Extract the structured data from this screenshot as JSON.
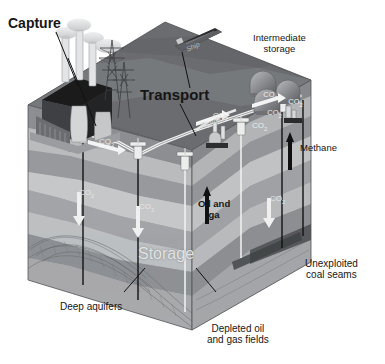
{
  "figure": {
    "style": "isometric cutaway block diagram, grayscale"
  },
  "labels": {
    "capture": "Capture",
    "transport": "Transport",
    "intermediate_storage": "Intermediate\nstorage",
    "storage": "Storage",
    "methane": "Methane",
    "oil_and_gas": "Oil and\nga",
    "deep_aquifers": "Deep aquifers",
    "depleted_fields": "Depleted oil\nand gas fields",
    "coal_seams": "Unexploited\ncoal seams",
    "pipeline": "Pipeline",
    "ship": "Ship"
  },
  "gas_labels": {
    "co2": "CO",
    "co2_sub": "2",
    "surface_1": "CO2",
    "surface_2": "CO2",
    "surface_3": "CO2",
    "tank_1": "CO2",
    "tank_2": "CO2",
    "tank_3": "CO2",
    "under_aquifer": "CO2",
    "under_depleted": "CO2",
    "under_coal": "CO2"
  },
  "colors": {
    "background": "#ffffff",
    "top_surface": "#6d6f72",
    "top_surface_light": "#8b8d90",
    "front_face_top": "#97999c",
    "front_face_mid": "#b4b6b8",
    "front_face_light": "#cfd0d1",
    "front_face_dark": "#7d7f82",
    "side_face": "#8a8c8f",
    "side_face_light": "#a5a7a9",
    "plant_dark": "#1d1d1d",
    "plant_body": "#5d5f62",
    "pipe": "#e6e6e6",
    "text_dark": "#161616",
    "text_faint": "#dcdcdc",
    "arrow_white": "#f2f2f2",
    "arrow_black": "#111111",
    "coal_seam": "#4a4c4f"
  },
  "annotations": {
    "capture_leader": "leader line from Capture label to power plant",
    "transport_leader_ship": "leader line from Transport label to ship",
    "transport_leader_pipe": "leader line from Transport label to pipeline",
    "storage_leader_left": "leader line from Storage label to aquifer",
    "storage_leader_right": "leader line from Storage label to depleted field"
  }
}
